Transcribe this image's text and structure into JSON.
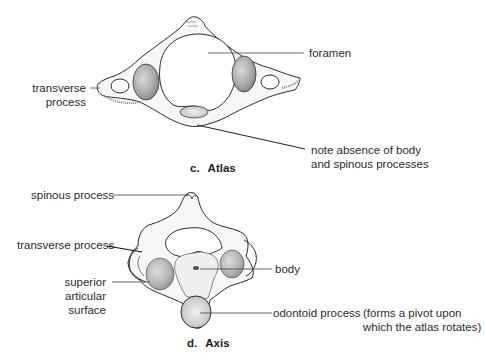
{
  "figure": {
    "atlas": {
      "caption_letter": "c.",
      "caption_name": "Atlas",
      "labels": {
        "foramen": "foramen",
        "transverse_process_line1": "transverse",
        "transverse_process_line2": "process",
        "note_line1": "note absence of body",
        "note_line2": "and spinous processes"
      }
    },
    "axis": {
      "caption_letter": "d.",
      "caption_name": "Axis",
      "labels": {
        "spinous_process": "spinous process",
        "transverse_process": "transverse process",
        "superior_articular_surface_line1": "superior",
        "superior_articular_surface_line2": "articular",
        "superior_articular_surface_line3": "surface",
        "body": "body",
        "odontoid_process": "odontoid process",
        "odontoid_note_line1": "(forms a pivot upon",
        "odontoid_note_line2": "which the atlas rotates)"
      }
    },
    "colors": {
      "ink": "#2b2b2b",
      "bone_fill": "#f7f7f5",
      "shade": "#9a9a9a"
    }
  }
}
